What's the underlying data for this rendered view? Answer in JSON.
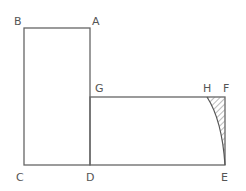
{
  "diagram": {
    "points": {
      "A": {
        "label": "A",
        "x": 90,
        "y": 28
      },
      "B": {
        "label": "B",
        "x": 24,
        "y": 28
      },
      "C": {
        "label": "C",
        "x": 24,
        "y": 165
      },
      "D": {
        "label": "D",
        "x": 90,
        "y": 165
      },
      "E": {
        "label": "E",
        "x": 225,
        "y": 165
      },
      "F": {
        "label": "F",
        "x": 225,
        "y": 97
      },
      "G": {
        "label": "G",
        "x": 90,
        "y": 97
      },
      "H": {
        "label": "H",
        "x": 207,
        "y": 97
      }
    },
    "line_color": "#666666",
    "hatch_color": "#777777"
  }
}
